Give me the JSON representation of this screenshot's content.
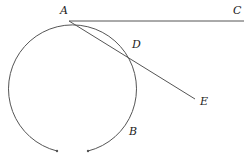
{
  "figure": {
    "type": "geometry-diagram",
    "colors": {
      "stroke": "#555555",
      "label": "#222222",
      "background": "#ffffff"
    },
    "points": {
      "A": {
        "label": "A",
        "x": 69,
        "y": 21,
        "label_x": 60,
        "label_y": 14
      },
      "C": {
        "label": "C",
        "x": 244,
        "y": 21,
        "label_x": 233,
        "label_y": 14
      },
      "D": {
        "label": "D",
        "x": 126,
        "y": 55,
        "label_x": 132,
        "label_y": 48
      },
      "E": {
        "label": "E",
        "x": 195,
        "y": 99,
        "label_x": 200,
        "label_y": 105
      },
      "B": {
        "label": "B",
        "x": 128,
        "y": 128,
        "label_x": 129,
        "label_y": 135
      }
    },
    "circle": {
      "cx": 70,
      "cy": 85,
      "r": 64,
      "gap_left_end": [
        57,
        151
      ],
      "gap_right_end": [
        88,
        151
      ]
    },
    "segments": [
      {
        "name": "tangent-AC",
        "from": "A",
        "to": "C"
      },
      {
        "name": "secant-AE",
        "from": "A",
        "to": "E"
      }
    ]
  }
}
